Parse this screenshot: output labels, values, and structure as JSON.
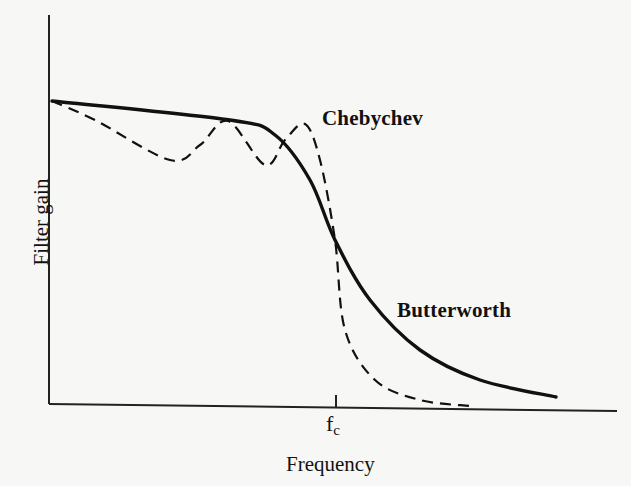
{
  "chart_data": {
    "type": "line",
    "title": "",
    "xlabel": "Frequency",
    "ylabel": "Filter gain",
    "x_ticks": [
      {
        "label": "f",
        "subscript": "c",
        "position": "cutoff frequency"
      }
    ],
    "grid": false,
    "legend": "inline labels",
    "series": [
      {
        "name": "Chebychev",
        "style": "dashed",
        "description": "Ripple in passband (equiripple), sharp roll-off near fc",
        "points_px": [
          [
            52,
            101
          ],
          [
            95,
            120
          ],
          [
            170,
            160
          ],
          [
            200,
            145
          ],
          [
            228,
            121
          ],
          [
            265,
            165
          ],
          [
            285,
            140
          ],
          [
            305,
            124
          ],
          [
            320,
            160
          ],
          [
            335,
            240
          ],
          [
            345,
            330
          ],
          [
            375,
            380
          ],
          [
            420,
            400
          ],
          [
            470,
            406
          ]
        ]
      },
      {
        "name": "Butterworth",
        "style": "solid",
        "description": "Maximally flat passband, gradual roll-off",
        "points_px": [
          [
            52,
            101
          ],
          [
            230,
            120
          ],
          [
            275,
            135
          ],
          [
            310,
            180
          ],
          [
            335,
            240
          ],
          [
            370,
            300
          ],
          [
            420,
            350
          ],
          [
            480,
            380
          ],
          [
            556,
            397
          ]
        ]
      }
    ]
  },
  "labels": {
    "chebychev": "Chebychev",
    "butterworth": "Butterworth",
    "xlabel": "Frequency",
    "ylabel": "Filter gain",
    "tick_main": "f",
    "tick_sub": "c"
  }
}
